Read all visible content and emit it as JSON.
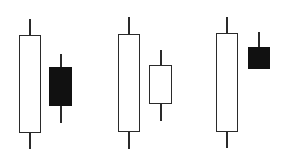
{
  "chart_data": {
    "type": "candlestick",
    "title": "",
    "xlabel": "",
    "ylabel": "",
    "grid": false,
    "legend": null,
    "note": "Three pairs of candlesticks (harami-style patterns); pixel y-coordinates used as price proxy (lower y = higher price). No axes or labels shown.",
    "groups": [
      {
        "name": "pair-1",
        "candles": [
          {
            "name": "candle-1",
            "color": "white",
            "high": 19,
            "open": 133,
            "close": 35,
            "low": 149,
            "x_left": 19,
            "x_right": 41
          },
          {
            "name": "candle-2",
            "color": "black",
            "high": 54,
            "open": 67,
            "close": 106,
            "low": 123,
            "x_left": 49,
            "x_right": 72
          }
        ]
      },
      {
        "name": "pair-2",
        "candles": [
          {
            "name": "candle-3",
            "color": "white",
            "high": 17,
            "open": 132,
            "close": 34,
            "low": 149,
            "x_left": 118,
            "x_right": 140
          },
          {
            "name": "candle-4",
            "color": "white",
            "high": 50,
            "open": 104,
            "close": 65,
            "low": 121,
            "x_left": 149,
            "x_right": 172
          }
        ]
      },
      {
        "name": "pair-3",
        "candles": [
          {
            "name": "candle-5",
            "color": "white",
            "high": 17,
            "open": 132,
            "close": 33,
            "low": 148,
            "x_left": 216,
            "x_right": 238
          },
          {
            "name": "candle-6",
            "color": "black",
            "high": 32,
            "open": 47,
            "close": 69,
            "low": 69,
            "x_left": 248,
            "x_right": 270
          }
        ]
      }
    ]
  },
  "colors": {
    "background": "#ffffff",
    "outline": "#2a2a2a",
    "bear_fill": "#111111",
    "bull_fill": "#ffffff"
  }
}
